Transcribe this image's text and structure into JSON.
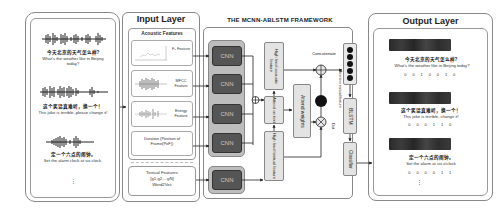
{
  "input_audio": {
    "samples": [
      {
        "zh": "今天北京的天气怎么样?",
        "en": "What's the weather like in Beijing today?"
      },
      {
        "zh": "这个笑话真难听，换一个！",
        "en": "This joke is terrible, please change it!"
      },
      {
        "zh": "定一个六点的闹钟。",
        "en": "Set the alarm clock at six clock."
      }
    ],
    "ellipsis": "⋮"
  },
  "input_layer": {
    "title": "Input Layer",
    "acoustic_title": "Acoustic Features",
    "features": [
      {
        "label": "F₀ Feature"
      },
      {
        "label": "MFCC Feature"
      },
      {
        "label": "Energy Feature"
      },
      {
        "label": "Duration (Position of Frame(PoF))"
      }
    ],
    "textual": {
      "title": "Textual Features",
      "formula": "[g1,g2,...gN]",
      "method": "Word2Vec"
    }
  },
  "framework": {
    "title": "THE MCNN-ABLSTM FRAMEWORK",
    "cnn_label": "CNN",
    "cnn_count": 5,
    "boxes": {
      "high_acoustic": "High level acoustic feature",
      "attend": "Attend on text",
      "high_textual": "High level textual feature",
      "attend_weights": "Attend weights",
      "attentive_textual": "Attentive textual feature",
      "blstm": "BLSTM",
      "classifier": "Classifier"
    },
    "ops": {
      "concatenate": "Concatenate",
      "dot": "Dot"
    }
  },
  "output_layer": {
    "title": "Output Layer",
    "results": [
      {
        "zh": "今天北京的天气怎么样?",
        "en": "What's the weather like in Beijing today?",
        "bits": "0 0 1 0 0 1 0"
      },
      {
        "zh": "这个笑话真难听，换一个！",
        "en": "This joke is terrible, change it!",
        "bits": "0 0 0 1 1 0"
      },
      {
        "zh": "定一个六点的闹钟。",
        "en": "Set the alarm at six o'clock",
        "bits": "0 0 0 0 1 1"
      }
    ],
    "ellipsis": "⋮"
  }
}
